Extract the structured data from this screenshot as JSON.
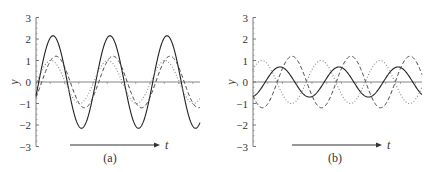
{
  "chart_data": [
    {
      "type": "line",
      "panel": "a",
      "caption": "(a)",
      "xlabel": "t",
      "ylabel": "y",
      "ylim": [
        -3,
        3
      ],
      "yticks": [
        3,
        2,
        1,
        0,
        -1,
        -2,
        -3
      ],
      "ytick_labels": [
        "3",
        "2",
        "1",
        "0",
        "−1",
        "−2",
        "−3"
      ],
      "grid": false,
      "description": "Two waves nearly in phase (dashed and dotted) superpose into a larger-amplitude resultant (solid): constructive interference",
      "series": [
        {
          "name": "resultant",
          "style": "solid",
          "amplitude": 2.15,
          "period_px": 57,
          "peak_px": [
            53,
            110,
            167
          ]
        },
        {
          "name": "wave 1",
          "style": "dashed",
          "amplitude": 1.2,
          "period_px": 57,
          "peak_px": [
            56,
            113,
            170
          ]
        },
        {
          "name": "wave 2",
          "style": "dotted",
          "amplitude": 1.0,
          "period_px": 57,
          "peak_px": [
            51,
            108,
            165
          ]
        }
      ]
    },
    {
      "type": "line",
      "panel": "b",
      "caption": "(b)",
      "xlabel": "t",
      "ylabel": "y",
      "ylim": [
        -3,
        3
      ],
      "yticks": [
        3,
        2,
        1,
        0,
        -1,
        -2,
        -3
      ],
      "ytick_labels": [
        "3",
        "2",
        "1",
        "0",
        "−1",
        "−2",
        "−3"
      ],
      "grid": false,
      "description": "Two waves nearly out of phase (dashed and dotted) superpose into a small-amplitude resultant (solid): destructive interference",
      "series": [
        {
          "name": "resultant",
          "style": "solid",
          "amplitude": 0.7,
          "period_px": 59,
          "peak_px": [
            280,
            340,
            398
          ]
        },
        {
          "name": "wave 1",
          "style": "dashed",
          "amplitude": 1.2,
          "period_px": 59,
          "peak_px": [
            292,
            350,
            408
          ]
        },
        {
          "name": "wave 2",
          "style": "dotted",
          "amplitude": 1.0,
          "period_px": 59,
          "peak_px": [
            262,
            322,
            382
          ]
        }
      ]
    }
  ],
  "layout": {
    "panels": [
      {
        "x_axis_start": 36,
        "x_axis_end": 200,
        "zero_y": 82,
        "unit_px": 21.5,
        "arrow_x1": 70,
        "arrow_x2": 160,
        "arrow_y": 145,
        "caption_x": 110,
        "caption_y": 162
      },
      {
        "x_axis_start": 253,
        "x_axis_end": 422,
        "zero_y": 82,
        "unit_px": 21.5,
        "arrow_x1": 292,
        "arrow_x2": 382,
        "arrow_y": 145,
        "caption_x": 335,
        "caption_y": 162
      }
    ]
  }
}
